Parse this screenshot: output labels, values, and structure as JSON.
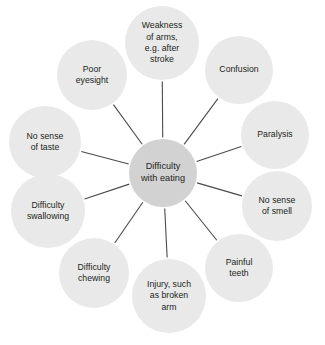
{
  "diagram": {
    "type": "radial-spoke-diagram",
    "title": "Difficulty with eating",
    "colors": {
      "background": "#ffffff",
      "center_fill": "#d2d2d2",
      "outer_fill": "#e9e9e9",
      "spoke_line": "#4a4a4a",
      "text": "#231f20"
    },
    "center": {
      "label": "Difficulty\nwith eating",
      "cx": 163,
      "cy": 173,
      "r": 34
    },
    "nodes": [
      {
        "id": "weakness-of-arms",
        "label": "Weakness\nof arms,\ne.g. after\nstroke",
        "cx": 162,
        "cy": 43,
        "r": 37
      },
      {
        "id": "confusion",
        "label": "Confusion",
        "cx": 239,
        "cy": 70,
        "r": 34
      },
      {
        "id": "paralysis",
        "label": "Paralysis",
        "cx": 275,
        "cy": 135,
        "r": 34
      },
      {
        "id": "no-sense-of-smell",
        "label": "No sense\nof smell",
        "cx": 277,
        "cy": 206,
        "r": 35
      },
      {
        "id": "painful-teeth",
        "label": "Painful\nteeth",
        "cx": 239,
        "cy": 268,
        "r": 34
      },
      {
        "id": "injury-broken-arm",
        "label": "Injury, such\nas broken\narm",
        "cx": 169,
        "cy": 296,
        "r": 37
      },
      {
        "id": "difficulty-chewing",
        "label": "Difficulty\nchewing",
        "cx": 94,
        "cy": 273,
        "r": 35
      },
      {
        "id": "difficulty-swallowing",
        "label": "Difficulty\nswallowing",
        "cx": 48,
        "cy": 211,
        "r": 37
      },
      {
        "id": "no-sense-of-taste",
        "label": "No sense\nof taste",
        "cx": 45,
        "cy": 142,
        "r": 36
      },
      {
        "id": "poor-eyesight",
        "label": "Poor\neyesight",
        "cx": 92,
        "cy": 75,
        "r": 35
      }
    ]
  }
}
